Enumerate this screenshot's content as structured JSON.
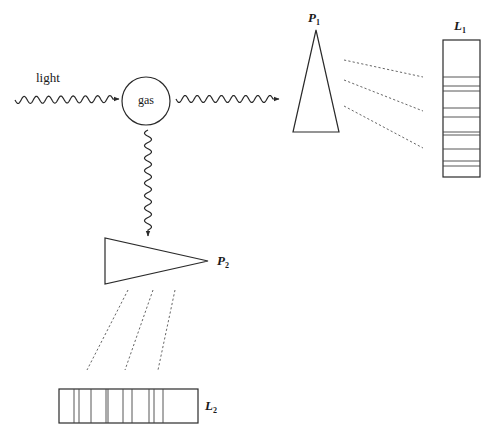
{
  "diagram": {
    "labels": {
      "light": "light",
      "gas": "gas",
      "prism1": "P",
      "prism1_sub": "1",
      "prism2": "P",
      "prism2_sub": "2",
      "spectrum1": "L",
      "spectrum1_sub": "1",
      "spectrum2": "L",
      "spectrum2_sub": "2"
    },
    "colors": {
      "stroke": "#2a2a2a",
      "background": "#ffffff"
    },
    "spectrum1": {
      "orientation": "vertical",
      "box": {
        "x": 443,
        "y": 40,
        "width": 37,
        "height": 137
      },
      "line_y": [
        77,
        86,
        91,
        108,
        117,
        132,
        135,
        149,
        161,
        166
      ]
    },
    "spectrum2": {
      "orientation": "horizontal",
      "box": {
        "x": 59,
        "y": 389,
        "width": 139,
        "height": 34
      },
      "line_x": [
        74,
        79,
        91,
        106,
        108,
        123,
        132,
        149,
        154,
        163
      ]
    },
    "prism1": {
      "points": [
        [
          316,
          30
        ],
        [
          293,
          132
        ],
        [
          339,
          132
        ]
      ]
    },
    "prism2": {
      "points": [
        [
          105,
          238
        ],
        [
          105,
          284
        ],
        [
          208,
          261
        ]
      ]
    },
    "gas_circle": {
      "cx": 146,
      "cy": 101,
      "r": 24
    },
    "dashed_rays_p1": [
      [
        [
          344,
          60
        ],
        [
          423,
          77
        ]
      ],
      [
        [
          344,
          80
        ],
        [
          423,
          111
        ]
      ],
      [
        [
          344,
          106
        ],
        [
          423,
          148
        ]
      ]
    ],
    "dashed_rays_p2": [
      [
        [
          128,
          290
        ],
        [
          87,
          370
        ]
      ],
      [
        [
          153,
          290
        ],
        [
          125,
          370
        ]
      ],
      [
        [
          175,
          290
        ],
        [
          158,
          370
        ]
      ]
    ]
  }
}
